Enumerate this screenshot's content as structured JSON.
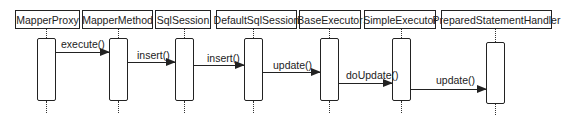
{
  "diagram": {
    "type": "sequence",
    "participants": [
      {
        "id": "p0",
        "label": "MapperProxy",
        "box": [
          15,
          80
        ],
        "lifeline_x": 46,
        "act": [
          37,
          101
        ]
      },
      {
        "id": "p1",
        "label": "MapperMethod",
        "box": [
          82,
          153
        ],
        "lifeline_x": 118,
        "act": [
          38,
          101
        ]
      },
      {
        "id": "p2",
        "label": "SqlSession",
        "box": [
          155,
          211
        ],
        "lifeline_x": 184,
        "act": [
          38,
          101
        ]
      },
      {
        "id": "p3",
        "label": "DefaultSqlSession",
        "box": [
          216,
          297
        ],
        "lifeline_x": 253,
        "act": [
          38,
          101
        ]
      },
      {
        "id": "p4",
        "label": "BaseExecutor",
        "box": [
          299,
          361
        ],
        "lifeline_x": 329,
        "act": [
          38,
          101
        ]
      },
      {
        "id": "p5",
        "label": "SimpleExecutor",
        "box": [
          364,
          436
        ],
        "lifeline_x": 401,
        "act": [
          38,
          101
        ]
      },
      {
        "id": "p6",
        "label": "PreparedStatementHandler",
        "box": [
          441,
          552
        ],
        "lifeline_x": 495,
        "act": [
          42,
          104
        ]
      }
    ],
    "messages": [
      {
        "label": "execute()",
        "from": "MapperProxy",
        "to": "MapperMethod",
        "y": 52,
        "x1": 56,
        "x2": 109,
        "label_x": 61,
        "label_y": 38
      },
      {
        "label": "insert()",
        "from": "MapperMethod",
        "to": "SqlSession",
        "y": 62,
        "x1": 127,
        "x2": 175,
        "label_x": 137,
        "label_y": 49
      },
      {
        "label": "insert()",
        "from": "SqlSession",
        "to": "DefaultSqlSession",
        "y": 65,
        "x1": 193,
        "x2": 244,
        "label_x": 207,
        "label_y": 52
      },
      {
        "label": "update()",
        "from": "DefaultSqlSession",
        "to": "BaseExecutor",
        "y": 72,
        "x1": 262,
        "x2": 320,
        "label_x": 273,
        "label_y": 59
      },
      {
        "label": "doUpdate()",
        "from": "BaseExecutor",
        "to": "SimpleExecutor",
        "y": 83,
        "x1": 338,
        "x2": 392,
        "label_x": 346,
        "label_y": 69
      },
      {
        "label": "update()",
        "from": "SimpleExecutor",
        "to": "PreparedStatementHandler",
        "y": 89,
        "x1": 410,
        "x2": 486,
        "label_x": 436,
        "label_y": 74
      }
    ]
  }
}
